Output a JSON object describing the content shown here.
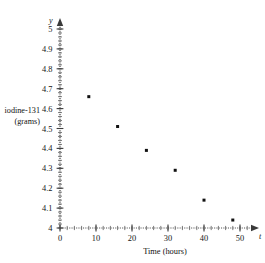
{
  "chart_data": {
    "type": "scatter",
    "title": "",
    "xlabel": "Time (hours)",
    "ylabel": "iodine-131 (grams)",
    "ylabel_lines": [
      "iodine-131",
      "(grams)"
    ],
    "x_axis_variable": "t",
    "y_axis_variable": "y",
    "xlim": [
      0,
      55
    ],
    "ylim": [
      4,
      5.05
    ],
    "grid": false,
    "legend": null,
    "x_ticks": [
      0,
      10,
      20,
      30,
      40,
      50
    ],
    "x_tick_labels": [
      "0",
      "10",
      "20",
      "30",
      "40",
      "50"
    ],
    "x_minor_tick_step": 2,
    "y_ticks": [
      4,
      4.1,
      4.2,
      4.3,
      4.4,
      4.5,
      4.6,
      4.7,
      4.8,
      4.9,
      5
    ],
    "y_tick_labels": [
      "4",
      "4.1",
      "4.2",
      "4.3",
      "4.4",
      "4.5",
      "4.6",
      "4.7",
      "4.8",
      "4.9",
      "5"
    ],
    "y_minor_tick_step": 0.02,
    "x": [
      8,
      16,
      24,
      32,
      40,
      48
    ],
    "values": [
      4.66,
      4.51,
      4.39,
      4.29,
      4.14,
      4.04
    ],
    "points": [
      {
        "x": 8,
        "y": 4.66
      },
      {
        "x": 16,
        "y": 4.51
      },
      {
        "x": 24,
        "y": 4.39
      },
      {
        "x": 32,
        "y": 4.29
      },
      {
        "x": 40,
        "y": 4.14
      },
      {
        "x": 48,
        "y": 4.04
      }
    ],
    "marker_color": "#111111",
    "axis_color": "#555555"
  }
}
